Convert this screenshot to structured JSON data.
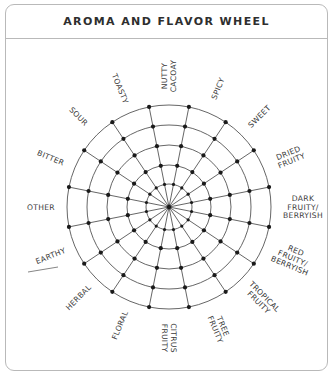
{
  "title": "AROMA AND FLAVOR WHEEL",
  "wheel": {
    "center": [
      169,
      207
    ],
    "ring_radii": [
      23,
      42,
      62,
      82,
      102
    ],
    "spoke_count": 16,
    "spoke_offset_deg": 11.25,
    "line_color": "#555555",
    "dot_color": "#1a1a1a",
    "label_radius": 128
  },
  "attributes": [
    {
      "name": "SPICY",
      "lines": [
        "SPICY"
      ],
      "angle": 11.25
    },
    {
      "name": "SWEET",
      "lines": [
        "SWEET"
      ],
      "angle": 33.75
    },
    {
      "name": "DRIED FRUITY",
      "lines": [
        "DRIED",
        "FRUITY"
      ],
      "angle": 56.25
    },
    {
      "name": "DARK FRUITY/BERRYISH",
      "lines": [
        "DARK",
        "FRUITY/",
        "BERRYISH"
      ],
      "angle": 78.75
    },
    {
      "name": "RED FRUITY/BERRYISH",
      "lines": [
        "RED",
        "FRUITY/",
        "BERRYISH"
      ],
      "angle": 101.25
    },
    {
      "name": "TROPICAL FRUITY",
      "lines": [
        "TROPICAL",
        "FRUITY"
      ],
      "angle": 123.75
    },
    {
      "name": "TREE FRUITY",
      "lines": [
        "TREE",
        "FRUITY"
      ],
      "angle": 146.25
    },
    {
      "name": "CITRUS FRUITY",
      "lines": [
        "CITRUS",
        "FRUITY"
      ],
      "angle": 168.75
    },
    {
      "name": "FLORAL",
      "lines": [
        "FLORAL"
      ],
      "angle": 191.25
    },
    {
      "name": "HERBAL",
      "lines": [
        "HERBAL"
      ],
      "angle": 213.75
    },
    {
      "name": "EARTHY",
      "lines": [
        "EARTHY"
      ],
      "angle": 236.25
    },
    {
      "name": "OTHER",
      "lines": [
        "OTHER"
      ],
      "angle": 258.75,
      "blank_line": true
    },
    {
      "name": "BITTER",
      "lines": [
        "BITTER"
      ],
      "angle": 281.25
    },
    {
      "name": "SOUR",
      "lines": [
        "SOUR"
      ],
      "angle": 303.75
    },
    {
      "name": "TOASTY",
      "lines": [
        "TOASTY"
      ],
      "angle": 326.25
    },
    {
      "name": "NUTTY CACOAY",
      "lines": [
        "NUTTY",
        "CACOAY"
      ],
      "angle": 348.75
    }
  ]
}
